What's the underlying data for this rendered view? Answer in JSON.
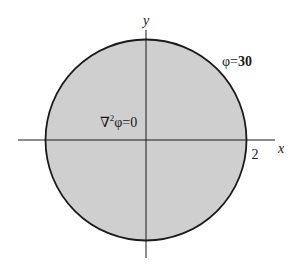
{
  "diagram": {
    "type": "circular-domain",
    "region": {
      "shape": "circle",
      "fill": "#cfcfcf",
      "stroke": "#1a1a1a",
      "radius_label": "2",
      "equation_inside": "∇²φ=0",
      "equation_parts": {
        "operator": "∇",
        "superscript": "2",
        "rest": "φ=0"
      }
    },
    "boundary_condition": {
      "label": "φ=30",
      "symbol": "φ",
      "equals": "=",
      "value": "30"
    },
    "axes": {
      "x_label": "x",
      "y_label": "y",
      "color": "#1a1a1a"
    }
  }
}
